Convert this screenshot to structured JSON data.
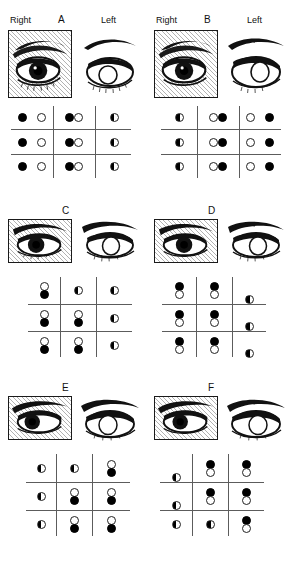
{
  "figure": {
    "caption_visible": false,
    "labels": {
      "right": "Right",
      "left": "Left"
    },
    "panel_ids": [
      "A",
      "B",
      "C",
      "D",
      "E",
      "F"
    ]
  },
  "panels": [
    {
      "id": "A",
      "position": "top-left",
      "shows_side_labels": true,
      "right_label": "Right",
      "left_label": "Left",
      "right_eye_shaded": true,
      "left_eye_shaded": false,
      "grid": {
        "type": "horizontal-pairs",
        "rows": 3,
        "cols": 3,
        "cells": [
          [
            [
              "filled",
              "open"
            ],
            [
              "filled",
              "open"
            ],
            [
              "half"
            ]
          ],
          [
            [
              "filled",
              "open"
            ],
            [
              "filled",
              "open"
            ],
            [
              "half"
            ]
          ],
          [
            [
              "filled",
              "open"
            ],
            [
              "filled",
              "open"
            ],
            [
              "half"
            ]
          ]
        ]
      }
    },
    {
      "id": "B",
      "position": "top-right",
      "shows_side_labels": true,
      "right_label": "Right",
      "left_label": "Left",
      "right_eye_shaded": true,
      "left_eye_shaded": false,
      "grid": {
        "type": "horizontal-pairs",
        "rows": 3,
        "cols": 3,
        "cells": [
          [
            [
              "half"
            ],
            [
              "open",
              "filled"
            ],
            [
              "open",
              "filled"
            ]
          ],
          [
            [
              "half"
            ],
            [
              "open",
              "filled"
            ],
            [
              "open",
              "filled"
            ]
          ],
          [
            [
              "half"
            ],
            [
              "open",
              "filled"
            ],
            [
              "open",
              "filled"
            ]
          ]
        ]
      }
    },
    {
      "id": "C",
      "position": "mid-left",
      "shows_side_labels": false,
      "right_eye_shaded": true,
      "left_eye_shaded": false,
      "grid": {
        "type": "vertical-pairs",
        "rows": 3,
        "cols": 3,
        "cells": [
          [
            [
              "open",
              "filled"
            ],
            [
              "half"
            ],
            [
              "half"
            ]
          ],
          [
            [
              "open",
              "filled"
            ],
            [
              "open",
              "filled"
            ],
            [
              "half"
            ]
          ],
          [
            [
              "open",
              "filled"
            ],
            [
              "open",
              "filled"
            ],
            [
              "half"
            ]
          ]
        ]
      }
    },
    {
      "id": "D",
      "position": "mid-right",
      "shows_side_labels": false,
      "right_eye_shaded": true,
      "left_eye_shaded": false,
      "grid": {
        "type": "vertical-pairs",
        "rows": 3,
        "cols": 3,
        "cells": [
          [
            [
              "filled",
              "open"
            ],
            [
              "filled",
              "open"
            ],
            [
              "half"
            ]
          ],
          [
            [
              "filled",
              "open"
            ],
            [
              "filled",
              "open"
            ],
            [
              "half"
            ]
          ],
          [
            [
              "filled",
              "open"
            ],
            [
              "filled",
              "open"
            ],
            [
              "half"
            ]
          ]
        ]
      }
    },
    {
      "id": "E",
      "position": "bottom-left",
      "shows_side_labels": false,
      "right_eye_shaded": true,
      "left_eye_shaded": false,
      "grid": {
        "type": "vertical-pairs",
        "rows": 3,
        "cols": 3,
        "cells": [
          [
            [
              "half"
            ],
            [
              "half"
            ],
            [
              "open",
              "filled"
            ]
          ],
          [
            [
              "half"
            ],
            [
              "open",
              "filled"
            ],
            [
              "open",
              "filled"
            ]
          ],
          [
            [
              "half"
            ],
            [
              "open",
              "filled"
            ],
            [
              "open",
              "filled"
            ]
          ]
        ]
      }
    },
    {
      "id": "F",
      "position": "bottom-right",
      "shows_side_labels": false,
      "right_eye_shaded": true,
      "left_eye_shaded": false,
      "grid": {
        "type": "vertical-pairs",
        "rows": 3,
        "cols": 3,
        "cells": [
          [
            [
              "half"
            ],
            [
              "filled",
              "open"
            ],
            [
              "filled",
              "open"
            ]
          ],
          [
            [
              "half"
            ],
            [
              "filled",
              "open"
            ],
            [
              "filled",
              "open"
            ]
          ],
          [
            [
              "half"
            ],
            [
              "half"
            ],
            [
              "filled",
              "open"
            ]
          ]
        ]
      }
    }
  ],
  "legend_symbols": {
    "filled": "filled-circle",
    "open": "open-circle",
    "half": "half-filled-circle"
  }
}
